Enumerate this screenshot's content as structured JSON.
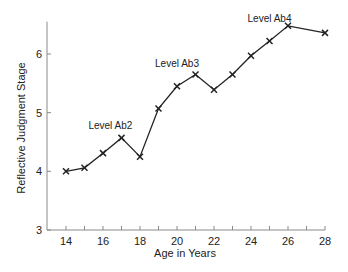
{
  "chart_data": {
    "type": "line",
    "title": "",
    "xlabel": "Age in Years",
    "ylabel": "Reflective Judgment Stage",
    "xlim": [
      13.3,
      28.1
    ],
    "ylim": [
      3,
      6.55
    ],
    "x_ticks": [
      14,
      15,
      16,
      17,
      18,
      19,
      20,
      21,
      22,
      23,
      24,
      25,
      26,
      27,
      28
    ],
    "x_tick_labels": [
      "14",
      "16",
      "18",
      "20",
      "22",
      "24",
      "26",
      "28"
    ],
    "x_tick_label_values": [
      14,
      16,
      18,
      20,
      22,
      24,
      26,
      28
    ],
    "y_ticks": [
      3,
      4,
      5,
      6
    ],
    "y_tick_labels": [
      "3",
      "4",
      "5",
      "6"
    ],
    "grid": false,
    "legend": null,
    "marker": "x",
    "series": [
      {
        "name": "Reflective Judgment Stage",
        "x": [
          14,
          15,
          16,
          17,
          18,
          19,
          20,
          21,
          22,
          23,
          24,
          25,
          26,
          28
        ],
        "values": [
          4.0,
          4.06,
          4.31,
          4.57,
          4.25,
          5.07,
          5.45,
          5.65,
          5.39,
          5.65,
          5.97,
          6.22,
          6.48,
          6.36
        ]
      }
    ],
    "annotations": [
      {
        "text": "Level Ab2",
        "x": 16.4,
        "y": 4.72
      },
      {
        "text": "Level Ab3",
        "x": 20.0,
        "y": 5.77
      },
      {
        "text": "Level Ab4",
        "x": 25.0,
        "y": 6.55
      }
    ]
  },
  "colors": {
    "line": "#222222",
    "axis": "#8a8a8a",
    "text": "#222222"
  }
}
